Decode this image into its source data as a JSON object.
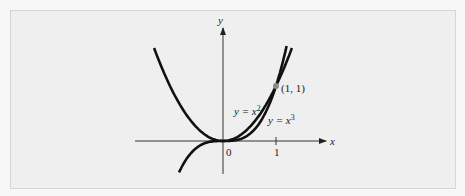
{
  "chart_data": {
    "type": "line",
    "title": "",
    "xlabel": "x",
    "ylabel": "y",
    "x_ticks": [
      {
        "value": 0,
        "label": "0"
      },
      {
        "value": 1,
        "label": "1"
      }
    ],
    "xlim": [
      -1.35,
      2.1
    ],
    "ylim": [
      -0.7,
      2.1
    ],
    "grid": false,
    "legend": "none",
    "series": [
      {
        "name": "y = x^2",
        "label_base": "y = x",
        "label_exp": "2",
        "x_range": [
          -1.3,
          1.3
        ],
        "function": "x^2"
      },
      {
        "name": "y = x^3",
        "label_base": "y = x",
        "label_exp": "3",
        "x_range": [
          -0.83,
          1.2
        ],
        "function": "x^3"
      }
    ],
    "annotations": [
      {
        "type": "point",
        "x": 1,
        "y": 1,
        "label": "(1, 1)"
      }
    ]
  },
  "colors": {
    "curve": "#111111",
    "axis": "#333333",
    "point": "#8a8a8a",
    "background": "#efefef",
    "border": "#d6d6d6"
  }
}
